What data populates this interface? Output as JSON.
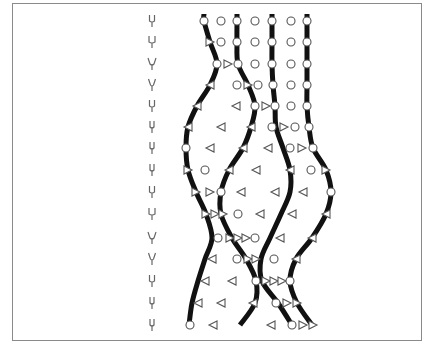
{
  "figure": {
    "frame": {
      "x": 12,
      "y": 3,
      "w": 410,
      "h": 338,
      "stroke": "#8a8a8a"
    },
    "colors": {
      "curve": "#111111",
      "marker_stroke": "#555555",
      "marker_fill": "#ffffff",
      "fork": "#666666"
    },
    "rows_y": [
      21,
      42,
      64,
      85,
      106,
      127,
      148,
      170,
      192,
      214,
      238,
      259,
      281,
      303,
      325
    ],
    "forks": {
      "x": 152,
      "widths": [
        5,
        6,
        8,
        7,
        5,
        4,
        4,
        4,
        5,
        6,
        8,
        7,
        5,
        4,
        4
      ]
    },
    "curves": [
      {
        "name": "strand-1",
        "points": [
          [
            204,
            14
          ],
          [
            204,
            21
          ],
          [
            210,
            42
          ],
          [
            217,
            64
          ],
          [
            210,
            85
          ],
          [
            197,
            106
          ],
          [
            188,
            127
          ],
          [
            186,
            148
          ],
          [
            188,
            170
          ],
          [
            196,
            192
          ],
          [
            206,
            214
          ],
          [
            212,
            238
          ],
          [
            205,
            259
          ],
          [
            198,
            281
          ],
          [
            192,
            303
          ],
          [
            189,
            325
          ]
        ]
      },
      {
        "name": "strand-2",
        "points": [
          [
            237,
            14
          ],
          [
            237,
            21
          ],
          [
            237,
            42
          ],
          [
            238,
            64
          ],
          [
            248,
            85
          ],
          [
            255,
            106
          ],
          [
            251,
            127
          ],
          [
            243,
            148
          ],
          [
            229,
            170
          ],
          [
            221,
            192
          ],
          [
            221,
            214
          ],
          [
            232,
            238
          ],
          [
            246,
            259
          ],
          [
            256,
            281
          ],
          [
            255,
            303
          ],
          [
            240,
            325
          ]
        ]
      },
      {
        "name": "strand-3",
        "points": [
          [
            272,
            14
          ],
          [
            272,
            21
          ],
          [
            272,
            42
          ],
          [
            272,
            64
          ],
          [
            273,
            85
          ],
          [
            275,
            106
          ],
          [
            276,
            127
          ],
          [
            283,
            148
          ],
          [
            290,
            170
          ],
          [
            290,
            192
          ],
          [
            281,
            214
          ],
          [
            270,
            238
          ],
          [
            261,
            259
          ],
          [
            262,
            281
          ],
          [
            278,
            303
          ],
          [
            292,
            325
          ]
        ]
      },
      {
        "name": "strand-4",
        "points": [
          [
            307,
            14
          ],
          [
            307,
            21
          ],
          [
            307,
            42
          ],
          [
            307,
            64
          ],
          [
            307,
            85
          ],
          [
            307,
            106
          ],
          [
            309,
            127
          ],
          [
            313,
            148
          ],
          [
            326,
            170
          ],
          [
            331,
            192
          ],
          [
            326,
            214
          ],
          [
            312,
            238
          ],
          [
            296,
            259
          ],
          [
            290,
            281
          ],
          [
            297,
            303
          ],
          [
            312,
            325
          ]
        ]
      }
    ],
    "markers": [
      {
        "t": "o",
        "x": 204,
        "y": 21
      },
      {
        "t": "o",
        "x": 221,
        "y": 21
      },
      {
        "t": "o",
        "x": 237,
        "y": 21
      },
      {
        "t": "o",
        "x": 255,
        "y": 21
      },
      {
        "t": "o",
        "x": 272,
        "y": 21
      },
      {
        "t": "o",
        "x": 291,
        "y": 21
      },
      {
        "t": "o",
        "x": 307,
        "y": 21
      },
      {
        "t": "r",
        "x": 210,
        "y": 42
      },
      {
        "t": "o",
        "x": 221,
        "y": 42
      },
      {
        "t": "o",
        "x": 237,
        "y": 42
      },
      {
        "t": "o",
        "x": 255,
        "y": 42
      },
      {
        "t": "o",
        "x": 272,
        "y": 42
      },
      {
        "t": "o",
        "x": 291,
        "y": 42
      },
      {
        "t": "o",
        "x": 307,
        "y": 42
      },
      {
        "t": "o",
        "x": 217,
        "y": 64
      },
      {
        "t": "r",
        "x": 228,
        "y": 64
      },
      {
        "t": "o",
        "x": 238,
        "y": 64
      },
      {
        "t": "o",
        "x": 255,
        "y": 64
      },
      {
        "t": "o",
        "x": 272,
        "y": 64
      },
      {
        "t": "o",
        "x": 291,
        "y": 64
      },
      {
        "t": "o",
        "x": 307,
        "y": 64
      },
      {
        "t": "l",
        "x": 210,
        "y": 85
      },
      {
        "t": "o",
        "x": 237,
        "y": 85
      },
      {
        "t": "r",
        "x": 248,
        "y": 85
      },
      {
        "t": "o",
        "x": 258,
        "y": 85
      },
      {
        "t": "o",
        "x": 273,
        "y": 85
      },
      {
        "t": "o",
        "x": 291,
        "y": 85
      },
      {
        "t": "o",
        "x": 307,
        "y": 85
      },
      {
        "t": "l",
        "x": 197,
        "y": 106
      },
      {
        "t": "l",
        "x": 236,
        "y": 106
      },
      {
        "t": "o",
        "x": 255,
        "y": 106
      },
      {
        "t": "r",
        "x": 266,
        "y": 106
      },
      {
        "t": "o",
        "x": 275,
        "y": 106
      },
      {
        "t": "o",
        "x": 291,
        "y": 106
      },
      {
        "t": "o",
        "x": 307,
        "y": 106
      },
      {
        "t": "l",
        "x": 188,
        "y": 127
      },
      {
        "t": "l",
        "x": 221,
        "y": 127
      },
      {
        "t": "l",
        "x": 251,
        "y": 127
      },
      {
        "t": "o",
        "x": 272,
        "y": 127
      },
      {
        "t": "r",
        "x": 284,
        "y": 127
      },
      {
        "t": "o",
        "x": 295,
        "y": 127
      },
      {
        "t": "o",
        "x": 309,
        "y": 127
      },
      {
        "t": "o",
        "x": 186,
        "y": 148
      },
      {
        "t": "l",
        "x": 210,
        "y": 148
      },
      {
        "t": "l",
        "x": 243,
        "y": 148
      },
      {
        "t": "l",
        "x": 268,
        "y": 148
      },
      {
        "t": "o",
        "x": 290,
        "y": 148
      },
      {
        "t": "r",
        "x": 302,
        "y": 148
      },
      {
        "t": "o",
        "x": 313,
        "y": 148
      },
      {
        "t": "r",
        "x": 188,
        "y": 170
      },
      {
        "t": "o",
        "x": 205,
        "y": 170
      },
      {
        "t": "l",
        "x": 229,
        "y": 170
      },
      {
        "t": "l",
        "x": 256,
        "y": 170
      },
      {
        "t": "l",
        "x": 290,
        "y": 170
      },
      {
        "t": "o",
        "x": 311,
        "y": 170
      },
      {
        "t": "r",
        "x": 326,
        "y": 170
      },
      {
        "t": "r",
        "x": 196,
        "y": 192
      },
      {
        "t": "r",
        "x": 210,
        "y": 192
      },
      {
        "t": "o",
        "x": 221,
        "y": 192
      },
      {
        "t": "l",
        "x": 241,
        "y": 192
      },
      {
        "t": "l",
        "x": 275,
        "y": 192
      },
      {
        "t": "l",
        "x": 303,
        "y": 192
      },
      {
        "t": "o",
        "x": 331,
        "y": 192
      },
      {
        "t": "r",
        "x": 206,
        "y": 214
      },
      {
        "t": "r",
        "x": 215,
        "y": 214
      },
      {
        "t": "r",
        "x": 223,
        "y": 214
      },
      {
        "t": "o",
        "x": 238,
        "y": 214
      },
      {
        "t": "l",
        "x": 260,
        "y": 214
      },
      {
        "t": "l",
        "x": 292,
        "y": 214
      },
      {
        "t": "l",
        "x": 326,
        "y": 214
      },
      {
        "t": "o",
        "x": 218,
        "y": 238
      },
      {
        "t": "r",
        "x": 230,
        "y": 238
      },
      {
        "t": "r",
        "x": 238,
        "y": 238
      },
      {
        "t": "r",
        "x": 246,
        "y": 238
      },
      {
        "t": "o",
        "x": 255,
        "y": 238
      },
      {
        "t": "l",
        "x": 280,
        "y": 238
      },
      {
        "t": "l",
        "x": 312,
        "y": 238
      },
      {
        "t": "l",
        "x": 212,
        "y": 259
      },
      {
        "t": "o",
        "x": 237,
        "y": 259
      },
      {
        "t": "r",
        "x": 248,
        "y": 259
      },
      {
        "t": "r",
        "x": 256,
        "y": 259
      },
      {
        "t": "o",
        "x": 274,
        "y": 259
      },
      {
        "t": "l",
        "x": 296,
        "y": 259
      },
      {
        "t": "l",
        "x": 205,
        "y": 281
      },
      {
        "t": "l",
        "x": 232,
        "y": 281
      },
      {
        "t": "o",
        "x": 256,
        "y": 281
      },
      {
        "t": "r",
        "x": 266,
        "y": 281
      },
      {
        "t": "r",
        "x": 274,
        "y": 281
      },
      {
        "t": "r",
        "x": 282,
        "y": 281
      },
      {
        "t": "o",
        "x": 290,
        "y": 281
      },
      {
        "t": "l",
        "x": 198,
        "y": 303
      },
      {
        "t": "l",
        "x": 221,
        "y": 303
      },
      {
        "t": "l",
        "x": 253,
        "y": 303
      },
      {
        "t": "o",
        "x": 276,
        "y": 303
      },
      {
        "t": "r",
        "x": 287,
        "y": 303
      },
      {
        "t": "r",
        "x": 297,
        "y": 303
      },
      {
        "t": "o",
        "x": 190,
        "y": 325
      },
      {
        "t": "l",
        "x": 213,
        "y": 325
      },
      {
        "t": "l",
        "x": 271,
        "y": 325
      },
      {
        "t": "o",
        "x": 292,
        "y": 325
      },
      {
        "t": "r",
        "x": 303,
        "y": 325
      },
      {
        "t": "r",
        "x": 313,
        "y": 325
      }
    ]
  }
}
